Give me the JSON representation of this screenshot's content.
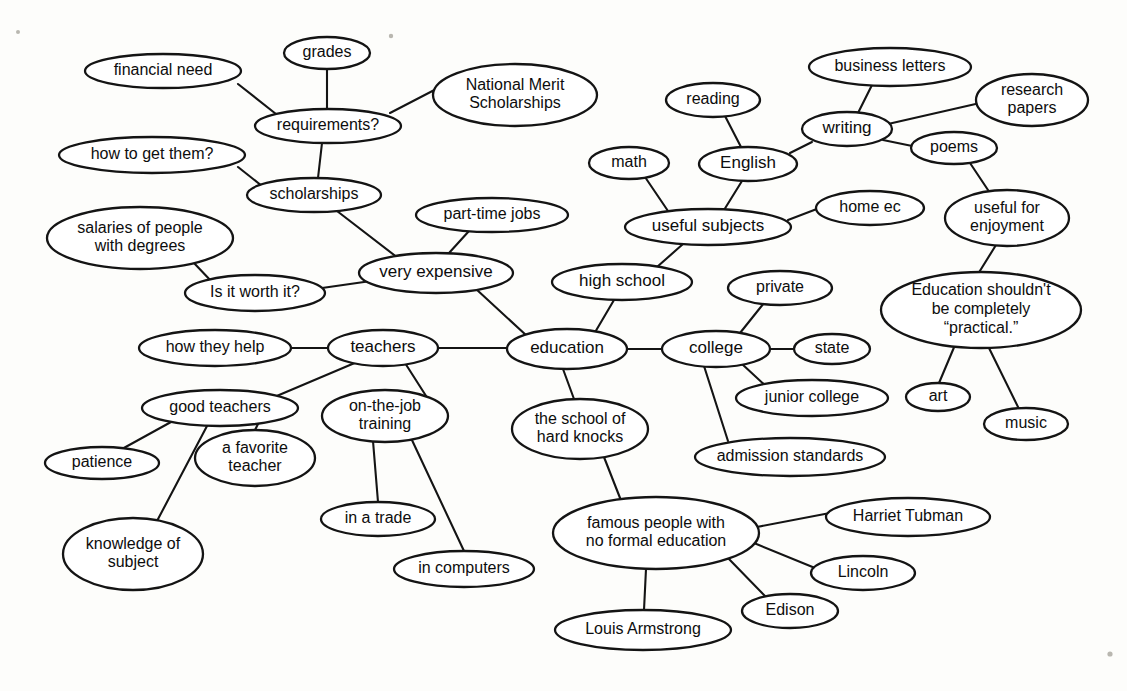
{
  "diagram": {
    "type": "mind-map",
    "background_color": "#fdfdfb",
    "line_color": "#141414",
    "node_fill": "#ffffff",
    "text_color": "#0d0d0d"
  },
  "nodes": [
    {
      "id": "education",
      "label": "education",
      "cx": 567,
      "cy": 349,
      "rx": 60,
      "ry": 20,
      "font": 17
    },
    {
      "id": "grades",
      "label": "grades",
      "cx": 327,
      "cy": 53,
      "rx": 43,
      "ry": 16,
      "font": 16
    },
    {
      "id": "financial-need",
      "label": "financial need",
      "cx": 163,
      "cy": 71,
      "rx": 78,
      "ry": 17,
      "font": 16
    },
    {
      "id": "requirements",
      "label": "requirements?",
      "cx": 328,
      "cy": 126,
      "rx": 73,
      "ry": 17,
      "font": 16
    },
    {
      "id": "national-merit",
      "label": "National Merit\nScholarships",
      "cx": 515,
      "cy": 95,
      "rx": 82,
      "ry": 31,
      "font": 16
    },
    {
      "id": "how-to-get-them",
      "label": "how to get them?",
      "cx": 152,
      "cy": 155,
      "rx": 93,
      "ry": 18,
      "font": 16
    },
    {
      "id": "scholarships",
      "label": "scholarships",
      "cx": 314,
      "cy": 195,
      "rx": 67,
      "ry": 17,
      "font": 16
    },
    {
      "id": "salaries",
      "label": "salaries of people\nwith degrees",
      "cx": 140,
      "cy": 238,
      "rx": 93,
      "ry": 31,
      "font": 16
    },
    {
      "id": "is-it-worth-it",
      "label": "Is it worth it?",
      "cx": 255,
      "cy": 293,
      "rx": 70,
      "ry": 18,
      "font": 16
    },
    {
      "id": "part-time-jobs",
      "label": "part-time jobs",
      "cx": 492,
      "cy": 215,
      "rx": 76,
      "ry": 17,
      "font": 16
    },
    {
      "id": "very-expensive",
      "label": "very expensive",
      "cx": 436,
      "cy": 273,
      "rx": 77,
      "ry": 20,
      "font": 17
    },
    {
      "id": "how-they-help",
      "label": "how they help",
      "cx": 215,
      "cy": 348,
      "rx": 76,
      "ry": 18,
      "font": 16
    },
    {
      "id": "teachers",
      "label": "teachers",
      "cx": 383,
      "cy": 348,
      "rx": 55,
      "ry": 18,
      "font": 17
    },
    {
      "id": "good-teachers",
      "label": "good teachers",
      "cx": 220,
      "cy": 408,
      "rx": 78,
      "ry": 18,
      "font": 16
    },
    {
      "id": "patience",
      "label": "patience",
      "cx": 102,
      "cy": 463,
      "rx": 57,
      "ry": 16,
      "font": 16
    },
    {
      "id": "a-favorite-teacher",
      "label": "a favorite\nteacher",
      "cx": 255,
      "cy": 458,
      "rx": 60,
      "ry": 28,
      "font": 16
    },
    {
      "id": "knowledge-of-subject",
      "label": "knowledge of\nsubject",
      "cx": 133,
      "cy": 554,
      "rx": 70,
      "ry": 36,
      "font": 16
    },
    {
      "id": "on-the-job-training",
      "label": "on-the-job\ntraining",
      "cx": 385,
      "cy": 416,
      "rx": 63,
      "ry": 26,
      "font": 16
    },
    {
      "id": "in-a-trade",
      "label": "in a trade",
      "cx": 378,
      "cy": 519,
      "rx": 57,
      "ry": 17,
      "font": 16
    },
    {
      "id": "in-computers",
      "label": "in computers",
      "cx": 464,
      "cy": 569,
      "rx": 70,
      "ry": 18,
      "font": 16
    },
    {
      "id": "hard-knocks",
      "label": "the school of\nhard knocks",
      "cx": 580,
      "cy": 429,
      "rx": 68,
      "ry": 30,
      "font": 16
    },
    {
      "id": "high-school",
      "label": "high school",
      "cx": 622,
      "cy": 282,
      "rx": 70,
      "ry": 18,
      "font": 17
    },
    {
      "id": "math",
      "label": "math",
      "cx": 629,
      "cy": 163,
      "rx": 40,
      "ry": 16,
      "font": 16
    },
    {
      "id": "reading",
      "label": "reading",
      "cx": 713,
      "cy": 100,
      "rx": 47,
      "ry": 17,
      "font": 16
    },
    {
      "id": "english",
      "label": "English",
      "cx": 748,
      "cy": 164,
      "rx": 49,
      "ry": 17,
      "font": 17
    },
    {
      "id": "useful-subjects",
      "label": "useful subjects",
      "cx": 708,
      "cy": 227,
      "rx": 83,
      "ry": 18,
      "font": 17
    },
    {
      "id": "home-ec",
      "label": "home ec",
      "cx": 870,
      "cy": 208,
      "rx": 54,
      "ry": 17,
      "font": 16
    },
    {
      "id": "writing",
      "label": "writing",
      "cx": 847,
      "cy": 129,
      "rx": 45,
      "ry": 17,
      "font": 17
    },
    {
      "id": "business-letters",
      "label": "business letters",
      "cx": 890,
      "cy": 67,
      "rx": 81,
      "ry": 19,
      "font": 16
    },
    {
      "id": "research-papers",
      "label": "research\npapers",
      "cx": 1032,
      "cy": 100,
      "rx": 56,
      "ry": 26,
      "font": 16
    },
    {
      "id": "poems",
      "label": "poems",
      "cx": 954,
      "cy": 148,
      "rx": 43,
      "ry": 16,
      "font": 16
    },
    {
      "id": "useful-for-enjoyment",
      "label": "useful for\nenjoyment",
      "cx": 1007,
      "cy": 218,
      "rx": 62,
      "ry": 28,
      "font": 16
    },
    {
      "id": "not-practical",
      "label": "Education shouldn't\nbe completely\n“practical.”",
      "cx": 981,
      "cy": 310,
      "rx": 100,
      "ry": 38,
      "font": 16
    },
    {
      "id": "art",
      "label": "art",
      "cx": 938,
      "cy": 397,
      "rx": 32,
      "ry": 14,
      "font": 16
    },
    {
      "id": "music",
      "label": "music",
      "cx": 1026,
      "cy": 424,
      "rx": 42,
      "ry": 16,
      "font": 16
    },
    {
      "id": "college",
      "label": "college",
      "cx": 716,
      "cy": 349,
      "rx": 54,
      "ry": 18,
      "font": 17
    },
    {
      "id": "private",
      "label": "private",
      "cx": 780,
      "cy": 288,
      "rx": 52,
      "ry": 17,
      "font": 16
    },
    {
      "id": "state",
      "label": "state",
      "cx": 832,
      "cy": 349,
      "rx": 38,
      "ry": 15,
      "font": 16
    },
    {
      "id": "junior-college",
      "label": "junior college",
      "cx": 812,
      "cy": 398,
      "rx": 76,
      "ry": 18,
      "font": 16
    },
    {
      "id": "admission-standards",
      "label": "admission standards",
      "cx": 790,
      "cy": 457,
      "rx": 95,
      "ry": 19,
      "font": 16
    },
    {
      "id": "famous-people",
      "label": "famous people with\nno formal education",
      "cx": 656,
      "cy": 533,
      "rx": 103,
      "ry": 36,
      "font": 16
    },
    {
      "id": "harriet-tubman",
      "label": "Harriet Tubman",
      "cx": 908,
      "cy": 517,
      "rx": 82,
      "ry": 19,
      "font": 16
    },
    {
      "id": "lincoln",
      "label": "Lincoln",
      "cx": 863,
      "cy": 573,
      "rx": 52,
      "ry": 17,
      "font": 16
    },
    {
      "id": "edison",
      "label": "Edison",
      "cx": 790,
      "cy": 611,
      "rx": 48,
      "ry": 17,
      "font": 16
    },
    {
      "id": "louis-armstrong",
      "label": "Louis Armstrong",
      "cx": 643,
      "cy": 630,
      "rx": 88,
      "ry": 20,
      "font": 16
    }
  ],
  "edges": [
    {
      "from": "financial-need",
      "to": "requirements",
      "x1": 238,
      "y1": 84,
      "x2": 276,
      "y2": 114
    },
    {
      "from": "grades",
      "to": "requirements",
      "x1": 327,
      "y1": 69,
      "x2": 327,
      "y2": 110
    },
    {
      "from": "requirements",
      "to": "national-merit",
      "x1": 390,
      "y1": 113,
      "x2": 444,
      "y2": 85
    },
    {
      "from": "requirements",
      "to": "scholarships",
      "x1": 322,
      "y1": 143,
      "x2": 318,
      "y2": 178
    },
    {
      "from": "how-to-get-them",
      "to": "scholarships",
      "x1": 238,
      "y1": 167,
      "x2": 262,
      "y2": 186
    },
    {
      "from": "scholarships",
      "to": "very-expensive",
      "x1": 337,
      "y1": 211,
      "x2": 398,
      "y2": 258
    },
    {
      "from": "salaries",
      "to": "is-it-worth-it",
      "x1": 193,
      "y1": 262,
      "x2": 213,
      "y2": 283
    },
    {
      "from": "is-it-worth-it",
      "to": "very-expensive",
      "x1": 322,
      "y1": 288,
      "x2": 371,
      "y2": 281
    },
    {
      "from": "part-time-jobs",
      "to": "very-expensive",
      "x1": 469,
      "y1": 231,
      "x2": 449,
      "y2": 253
    },
    {
      "from": "very-expensive",
      "to": "education",
      "x1": 476,
      "y1": 289,
      "x2": 527,
      "y2": 336
    },
    {
      "from": "how-they-help",
      "to": "teachers",
      "x1": 291,
      "y1": 348,
      "x2": 328,
      "y2": 348
    },
    {
      "from": "teachers",
      "to": "education",
      "x1": 438,
      "y1": 348,
      "x2": 507,
      "y2": 348
    },
    {
      "from": "teachers",
      "to": "good-teachers",
      "x1": 357,
      "y1": 362,
      "x2": 272,
      "y2": 398
    },
    {
      "from": "good-teachers",
      "to": "patience",
      "x1": 171,
      "y1": 422,
      "x2": 122,
      "y2": 449
    },
    {
      "from": "good-teachers",
      "to": "knowledge-of-subject",
      "x1": 207,
      "y1": 426,
      "x2": 157,
      "y2": 521
    },
    {
      "from": "good-teachers",
      "to": "a-favorite-teacher",
      "x1": 258,
      "y1": 424,
      "x2": 255,
      "y2": 430
    },
    {
      "from": "on-the-job-training",
      "to": "teachers",
      "x1": 428,
      "y1": 399,
      "x2": 405,
      "y2": 363
    },
    {
      "from": "on-the-job-training",
      "to": "in-a-trade",
      "x1": 373,
      "y1": 441,
      "x2": 378,
      "y2": 502
    },
    {
      "from": "on-the-job-training",
      "to": "in-computers",
      "x1": 411,
      "y1": 438,
      "x2": 464,
      "y2": 551
    },
    {
      "from": "education",
      "to": "hard-knocks",
      "x1": 563,
      "y1": 369,
      "x2": 574,
      "y2": 399
    },
    {
      "from": "education",
      "to": "high-school",
      "x1": 594,
      "y1": 334,
      "x2": 614,
      "y2": 300
    },
    {
      "from": "high-school",
      "to": "useful-subjects",
      "x1": 657,
      "y1": 267,
      "x2": 683,
      "y2": 244
    },
    {
      "from": "math",
      "to": "useful-subjects",
      "x1": 645,
      "y1": 177,
      "x2": 668,
      "y2": 211
    },
    {
      "from": "reading",
      "to": "english",
      "x1": 725,
      "y1": 116,
      "x2": 741,
      "y2": 147
    },
    {
      "from": "english",
      "to": "useful-subjects",
      "x1": 742,
      "y1": 181,
      "x2": 724,
      "y2": 210
    },
    {
      "from": "english",
      "to": "writing",
      "x1": 790,
      "y1": 153,
      "x2": 812,
      "y2": 142
    },
    {
      "from": "useful-subjects",
      "to": "home-ec",
      "x1": 788,
      "y1": 220,
      "x2": 822,
      "y2": 207
    },
    {
      "from": "writing",
      "to": "business-letters",
      "x1": 858,
      "y1": 113,
      "x2": 872,
      "y2": 85
    },
    {
      "from": "writing",
      "to": "research-papers",
      "x1": 888,
      "y1": 124,
      "x2": 980,
      "y2": 103
    },
    {
      "from": "writing",
      "to": "poems",
      "x1": 883,
      "y1": 140,
      "x2": 917,
      "y2": 147
    },
    {
      "from": "poems",
      "to": "useful-for-enjoyment",
      "x1": 968,
      "y1": 160,
      "x2": 990,
      "y2": 193
    },
    {
      "from": "useful-for-enjoyment",
      "to": "not-practical",
      "x1": 996,
      "y1": 245,
      "x2": 978,
      "y2": 274
    },
    {
      "from": "not-practical",
      "to": "art",
      "x1": 955,
      "y1": 345,
      "x2": 939,
      "y2": 383
    },
    {
      "from": "not-practical",
      "to": "music",
      "x1": 988,
      "y1": 346,
      "x2": 1019,
      "y2": 409
    },
    {
      "from": "education",
      "to": "college",
      "x1": 627,
      "y1": 349,
      "x2": 663,
      "y2": 349
    },
    {
      "from": "college",
      "to": "private",
      "x1": 740,
      "y1": 333,
      "x2": 764,
      "y2": 303
    },
    {
      "from": "college",
      "to": "state",
      "x1": 769,
      "y1": 349,
      "x2": 795,
      "y2": 349
    },
    {
      "from": "college",
      "to": "junior-college",
      "x1": 742,
      "y1": 364,
      "x2": 768,
      "y2": 388
    },
    {
      "from": "college",
      "to": "admission-standards",
      "x1": 704,
      "y1": 366,
      "x2": 728,
      "y2": 441
    },
    {
      "from": "hard-knocks",
      "to": "famous-people",
      "x1": 602,
      "y1": 452,
      "x2": 622,
      "y2": 503
    },
    {
      "from": "famous-people",
      "to": "harriet-tubman",
      "x1": 757,
      "y1": 527,
      "x2": 830,
      "y2": 513
    },
    {
      "from": "famous-people",
      "to": "lincoln",
      "x1": 754,
      "y1": 543,
      "x2": 815,
      "y2": 568
    },
    {
      "from": "famous-people",
      "to": "edison",
      "x1": 727,
      "y1": 557,
      "x2": 766,
      "y2": 597
    },
    {
      "from": "famous-people",
      "to": "louis-armstrong",
      "x1": 646,
      "y1": 569,
      "x2": 644,
      "y2": 610
    }
  ],
  "specks": [
    {
      "cx": 18,
      "cy": 32,
      "r": 2.0
    },
    {
      "cx": 391,
      "cy": 36,
      "r": 2.2
    },
    {
      "cx": 1110,
      "cy": 654,
      "r": 2.6
    }
  ]
}
